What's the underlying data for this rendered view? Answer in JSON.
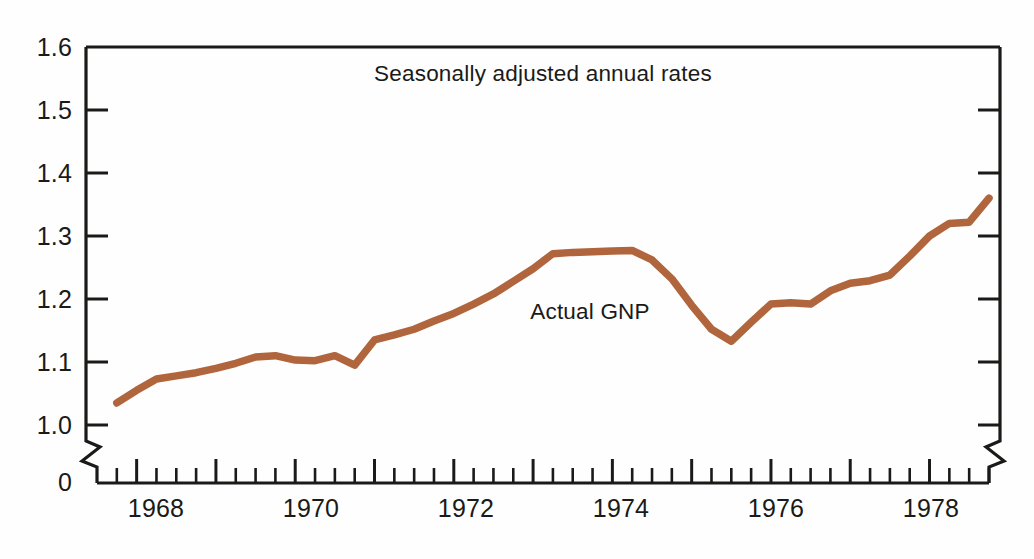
{
  "chart_data": {
    "type": "line",
    "title": "Seasonally adjusted annual rates",
    "xlabel": "",
    "ylabel": "",
    "xlim": [
      1967.5,
      1978.75
    ],
    "ylim": [
      1.0,
      1.6
    ],
    "grid": false,
    "legend_position": "inline-annotation",
    "axis_break": {
      "present": true,
      "from": 0,
      "to": 1.0,
      "note": "zigzag break on left and right vertical axes between 0 and 1.0"
    },
    "y_ticks": [
      "1.6",
      "1.5",
      "1.4",
      "1.3",
      "1.2",
      "1.1",
      "1.0",
      "0"
    ],
    "y_tick_values": [
      1.6,
      1.5,
      1.4,
      1.3,
      1.2,
      1.1,
      1.0,
      0
    ],
    "x_ticks": [
      "1968",
      "1970",
      "1972",
      "1974",
      "1976",
      "1978"
    ],
    "x_tick_values": [
      1968,
      1970,
      1972,
      1974,
      1976,
      1978
    ],
    "x_minor_tick_interval_years": 0.25,
    "annotations": [
      {
        "text": "Seasonally adjusted annual rates",
        "x": 1972.0,
        "y": 1.545
      },
      {
        "text": "Actual GNP",
        "x": 1973.1,
        "y": 1.205
      }
    ],
    "series": [
      {
        "name": "Actual GNP",
        "color": "#b0653c",
        "x": [
          1967.75,
          1968.0,
          1968.25,
          1968.5,
          1968.75,
          1969.0,
          1969.25,
          1969.5,
          1969.75,
          1970.0,
          1970.25,
          1970.5,
          1970.75,
          1971.0,
          1971.25,
          1971.5,
          1971.75,
          1972.0,
          1972.25,
          1972.5,
          1972.75,
          1973.0,
          1973.25,
          1973.5,
          1973.75,
          1974.0,
          1974.25,
          1974.5,
          1974.75,
          1975.0,
          1975.25,
          1975.5,
          1975.75,
          1976.0,
          1976.25,
          1976.5,
          1976.75,
          1977.0,
          1977.25,
          1977.5,
          1977.75,
          1978.0,
          1978.25,
          1978.5,
          1978.75
        ],
        "values": [
          1.035,
          1.055,
          1.073,
          1.078,
          1.083,
          1.09,
          1.098,
          1.108,
          1.11,
          1.103,
          1.102,
          1.11,
          1.095,
          1.135,
          1.143,
          1.152,
          1.165,
          1.177,
          1.192,
          1.208,
          1.228,
          1.248,
          1.272,
          1.274,
          1.275,
          1.276,
          1.277,
          1.262,
          1.232,
          1.19,
          1.152,
          1.133,
          1.163,
          1.192,
          1.194,
          1.192,
          1.213,
          1.225,
          1.229,
          1.238,
          1.268,
          1.3,
          1.32,
          1.322,
          1.36
        ]
      }
    ]
  },
  "axes": {
    "y_labels": [
      "1.6",
      "1.5",
      "1.4",
      "1.3",
      "1.2",
      "1.1",
      "1.0",
      "0"
    ],
    "x_labels": [
      "1968",
      "1970",
      "1972",
      "1974",
      "1976",
      "1978"
    ]
  },
  "labels": {
    "title_note": "Seasonally adjusted annual rates",
    "series_label": "Actual GNP"
  },
  "colors": {
    "series": "#b0653c",
    "axis": "#1a1a18",
    "background": "#fefefe"
  }
}
